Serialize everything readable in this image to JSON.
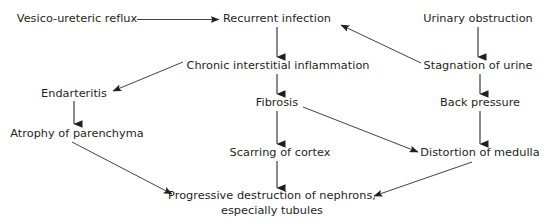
{
  "diagram": {
    "type": "flowchart",
    "width": 544,
    "height": 223,
    "background_color": "#ffffff",
    "text_color": "#231f20",
    "line_color": "#231f20",
    "nodes": [
      {
        "id": "vesico_ureteric_reflux",
        "label": "Vesico-ureteric reflux",
        "cx": 77,
        "cy": 19
      },
      {
        "id": "recurrent_infection",
        "label": "Recurrent infection",
        "cx": 277,
        "cy": 19
      },
      {
        "id": "urinary_obstruction",
        "label": "Urinary obstruction",
        "cx": 478,
        "cy": 19
      },
      {
        "id": "chronic_interstitial_inflammation",
        "label": "Chronic interstitial inflammation",
        "cx": 278,
        "cy": 66
      },
      {
        "id": "stagnation_of_urine",
        "label": "Stagnation of urine",
        "cx": 478,
        "cy": 66
      },
      {
        "id": "endarteritis",
        "label": "Endarteritis",
        "cx": 74,
        "cy": 94
      },
      {
        "id": "fibrosis",
        "label": "Fibrosis",
        "cx": 277,
        "cy": 103
      },
      {
        "id": "back_pressure",
        "label": "Back pressure",
        "cx": 480,
        "cy": 103
      },
      {
        "id": "atrophy_of_parenchyma",
        "label": "Atrophy of parenchyma",
        "cx": 77,
        "cy": 134
      },
      {
        "id": "scarring_of_cortex",
        "label": "Scarring of cortex",
        "cx": 280,
        "cy": 153
      },
      {
        "id": "distortion_of_medulla",
        "label": "Distortion of medulla",
        "cx": 480,
        "cy": 153
      },
      {
        "id": "progressive_destruction",
        "label": "Progressive destruction of nephrons, especially tubules",
        "line1": "Progressive destruction of nephrons,",
        "line2": "especially tubules",
        "cx": 272,
        "cy": 203
      }
    ],
    "edges": [
      {
        "id": "reflux-to-infection",
        "from": "vesico_ureteric_reflux",
        "to": "recurrent_infection",
        "kind": "horizontal"
      },
      {
        "id": "infection-to-inflammation",
        "from": "recurrent_infection",
        "to": "chronic_interstitial_inflammation",
        "kind": "vertical"
      },
      {
        "id": "inflammation-to-fibrosis",
        "from": "chronic_interstitial_inflammation",
        "to": "fibrosis",
        "kind": "vertical"
      },
      {
        "id": "inflammation-to-endarteritis",
        "from": "chronic_interstitial_inflammation",
        "to": "endarteritis",
        "kind": "diagonal"
      },
      {
        "id": "endarteritis-to-atrophy",
        "from": "endarteritis",
        "to": "atrophy_of_parenchyma",
        "kind": "vertical"
      },
      {
        "id": "atrophy-to-progressive-destruction",
        "from": "atrophy_of_parenchyma",
        "to": "progressive_destruction",
        "kind": "diagonal"
      },
      {
        "id": "fibrosis-to-scarring",
        "from": "fibrosis",
        "to": "scarring_of_cortex",
        "kind": "vertical"
      },
      {
        "id": "scarring-to-progressive-destruction",
        "from": "scarring_of_cortex",
        "to": "progressive_destruction",
        "kind": "vertical"
      },
      {
        "id": "fibrosis-to-distortion",
        "from": "fibrosis",
        "to": "distortion_of_medulla",
        "kind": "diagonal"
      },
      {
        "id": "obstruction-to-stagnation",
        "from": "urinary_obstruction",
        "to": "stagnation_of_urine",
        "kind": "vertical"
      },
      {
        "id": "stagnation-to-infection",
        "from": "stagnation_of_urine",
        "to": "recurrent_infection",
        "kind": "diagonal"
      },
      {
        "id": "stagnation-to-back-pressure",
        "from": "stagnation_of_urine",
        "to": "back_pressure",
        "kind": "vertical"
      },
      {
        "id": "back-pressure-to-distortion",
        "from": "back_pressure",
        "to": "distortion_of_medulla",
        "kind": "vertical"
      },
      {
        "id": "distortion-to-progressive-destruction",
        "from": "distortion_of_medulla",
        "to": "progressive_destruction",
        "kind": "diagonal"
      }
    ]
  }
}
